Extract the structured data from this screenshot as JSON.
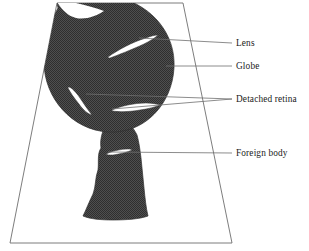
{
  "figure": {
    "background_color": "#ffffff",
    "ink_color": "#1a1a1a",
    "fill_color": "#595959",
    "frame": {
      "name": "trapezoid-frame",
      "stroke_color": "#6b6b6b",
      "points": "57,3 183,3 232,243 10,243"
    },
    "shapes": {
      "globe_fill": "#565656",
      "stem_fill": "#565656",
      "cavity_fill": "#ffffff"
    },
    "labels": [
      {
        "id": "lens",
        "text": "Lens",
        "x": 236,
        "y": 46,
        "leader_from_x": 201,
        "leader_from_y": 43,
        "leader_to_x": 139,
        "leader_to_y": 38
      },
      {
        "id": "globe",
        "text": "Globe",
        "x": 236,
        "y": 69,
        "leader_from_x": 201,
        "leader_from_y": 66,
        "leader_to_x": 166,
        "leader_to_y": 66
      },
      {
        "id": "detached-retina",
        "text": "Detached  retina",
        "x": 236,
        "y": 102,
        "leader_from_x": 232,
        "leader_from_y": 99,
        "leader_to_x": 86,
        "leader_to_y": 94,
        "leader2_to_x": 112,
        "leader2_to_y": 109
      },
      {
        "id": "foreign-body",
        "text": "Foreign body",
        "x": 236,
        "y": 156,
        "leader_from_x": 228,
        "leader_from_y": 153,
        "leader_to_x": 108,
        "leader_to_y": 152
      }
    ]
  }
}
